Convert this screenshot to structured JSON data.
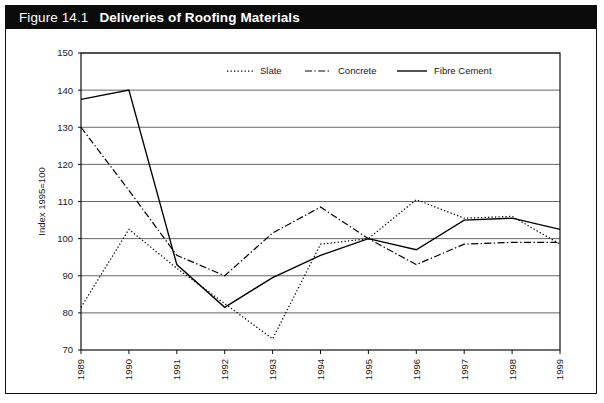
{
  "figure": {
    "number": "Figure 14.1",
    "title": "Deliveries of Roofing Materials"
  },
  "chart_data": {
    "type": "line",
    "title": "Deliveries of Roofing Materials",
    "xlabel": "",
    "ylabel": "Index 1995=100",
    "categories": [
      "1989",
      "1990",
      "1991",
      "1992",
      "1993",
      "1994",
      "1995",
      "1996",
      "1997",
      "1998",
      "1999"
    ],
    "x": [
      1989,
      1990,
      1991,
      1992,
      1993,
      1994,
      1995,
      1996,
      1997,
      1998,
      1999
    ],
    "ylim": [
      70,
      150
    ],
    "yticks": [
      70,
      80,
      90,
      100,
      110,
      120,
      130,
      140,
      150
    ],
    "grid": true,
    "legend_position": "top-center",
    "series": [
      {
        "name": "Slate",
        "style": "dotted",
        "values": [
          81.5,
          102.5,
          92.0,
          82.5,
          73.0,
          98.5,
          100.0,
          110.5,
          105.5,
          106.0,
          98.5
        ]
      },
      {
        "name": "Concrete",
        "style": "dash-dot",
        "values": [
          130.0,
          113.0,
          95.5,
          90.0,
          101.5,
          108.5,
          100.0,
          93.0,
          98.5,
          99.0,
          99.0
        ]
      },
      {
        "name": "Fibre Cement",
        "style": "solid",
        "values": [
          137.5,
          140.0,
          93.0,
          81.5,
          89.5,
          95.5,
          100.0,
          97.0,
          105.0,
          105.5,
          102.5
        ]
      }
    ]
  },
  "legend": {
    "items": [
      {
        "label": "Slate",
        "style": "dotted"
      },
      {
        "label": "Concrete",
        "style": "dash-dot"
      },
      {
        "label": "Fibre Cement",
        "style": "solid"
      }
    ]
  },
  "axes": {
    "y_title": "Index 1995=100",
    "y_ticks": [
      "150",
      "140",
      "130",
      "120",
      "110",
      "100",
      "90",
      "80",
      "70"
    ],
    "x_ticks": [
      "1989",
      "1990",
      "1991",
      "1992",
      "1993",
      "1994",
      "1995",
      "1996",
      "1997",
      "1998",
      "1999"
    ]
  }
}
